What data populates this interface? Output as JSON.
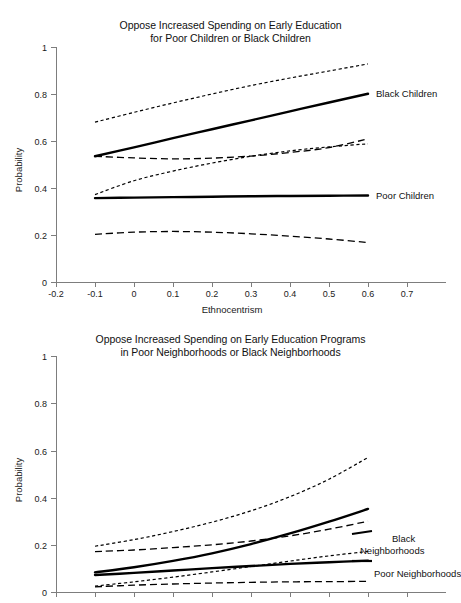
{
  "figure": {
    "background": "#ffffff",
    "ink_color": "#000000",
    "axis_color": "#7d7d7d"
  },
  "chart_data": [
    {
      "type": "line",
      "panel": "top",
      "title": "Oppose Increased Spending on Early Education for Poor Children or Black Children",
      "title_lines": [
        "Oppose Increased Spending on Early Education",
        "for Poor Children or Black Children"
      ],
      "xlabel": "Ethnocentrism",
      "ylabel": "Probability",
      "xlim": [
        -0.2,
        0.7
      ],
      "ylim": [
        0,
        1
      ],
      "xticks": [
        -0.2,
        -0.1,
        0,
        0.1,
        0.2,
        0.3,
        0.4,
        0.5,
        0.6,
        0.7
      ],
      "xticklabels": [
        "-0.2",
        "-0.1",
        "0",
        "0.1",
        "0.2",
        "0.3",
        "0.4",
        "0.5",
        "0.6",
        "0.7"
      ],
      "yticks": [
        0,
        0.2,
        0.4,
        0.6,
        0.8,
        1
      ],
      "yticklabels": [
        "0",
        "0.2",
        "0.4",
        "0.6",
        "0.8",
        "1"
      ],
      "grid": false,
      "legend_position": "inline-right-labels",
      "x": [
        -0.1,
        0.0,
        0.1,
        0.2,
        0.3,
        0.4,
        0.5,
        0.6
      ],
      "series": [
        {
          "name": "Black Children",
          "style": "solid",
          "role": "estimate",
          "label_text": "Black Children",
          "values": [
            0.535,
            0.573,
            0.612,
            0.65,
            0.688,
            0.726,
            0.764,
            0.801
          ]
        },
        {
          "name": "Black Children upper CI",
          "style": "dotted",
          "role": "confidence-upper",
          "values": [
            0.68,
            0.722,
            0.762,
            0.8,
            0.836,
            0.868,
            0.898,
            0.928
          ]
        },
        {
          "name": "Black Children lower CI",
          "style": "dotted",
          "role": "confidence-lower",
          "values": [
            0.372,
            0.431,
            0.472,
            0.506,
            0.535,
            0.558,
            0.575,
            0.588
          ]
        },
        {
          "name": "Poor Children",
          "style": "solid",
          "role": "estimate",
          "label_text": "Poor Children",
          "values": [
            0.357,
            0.359,
            0.361,
            0.363,
            0.365,
            0.366,
            0.367,
            0.368
          ]
        },
        {
          "name": "Poor Children upper CI",
          "style": "dashed",
          "role": "confidence-upper",
          "values": [
            0.535,
            0.528,
            0.524,
            0.527,
            0.536,
            0.551,
            0.572,
            0.609
          ]
        },
        {
          "name": "Poor Children lower CI",
          "style": "dashed",
          "role": "confidence-lower",
          "values": [
            0.203,
            0.212,
            0.215,
            0.212,
            0.205,
            0.195,
            0.183,
            0.168
          ]
        }
      ]
    },
    {
      "type": "line",
      "panel": "bottom",
      "title": "Oppose Increased Spending on Early Education Programs in Poor Neighborhoods or Black Neighborhoods",
      "title_lines": [
        "Oppose Increased Spending on Early Education Programs",
        "in Poor Neighborhoods or Black Neighborhoods"
      ],
      "xlabel": "",
      "ylabel": "Probability",
      "xlim": [
        -0.2,
        0.7
      ],
      "ylim": [
        0,
        1
      ],
      "xticks": [
        -0.2,
        -0.1,
        0,
        0.1,
        0.2,
        0.3,
        0.4,
        0.5,
        0.6,
        0.7
      ],
      "xticklabels": [
        "",
        "",
        "",
        "",
        "",
        "",
        "",
        "",
        "",
        ""
      ],
      "yticks": [
        0,
        0.2,
        0.4,
        0.6,
        0.8,
        1
      ],
      "yticklabels": [
        "0",
        "0.2",
        "0.4",
        "0.6",
        "0.8",
        "1"
      ],
      "grid": false,
      "legend_position": "inline-right-labels",
      "note": "x-axis tick labels are cropped off the bottom of the screenshot",
      "x": [
        -0.1,
        0.0,
        0.1,
        0.2,
        0.3,
        0.4,
        0.5,
        0.6
      ],
      "series": [
        {
          "name": "Black Neighborhoods",
          "style": "solid",
          "role": "estimate",
          "label_text": "Black Neighborhoods",
          "label_lines": [
            "Black",
            "Neighborhoods"
          ],
          "values": [
            0.083,
            0.105,
            0.132,
            0.164,
            0.203,
            0.248,
            0.298,
            0.352
          ]
        },
        {
          "name": "Black Neighborhoods upper CI",
          "style": "dotted",
          "role": "confidence-upper",
          "values": [
            0.194,
            0.222,
            0.256,
            0.296,
            0.344,
            0.404,
            0.478,
            0.57
          ]
        },
        {
          "name": "Black Neighborhoods lower CI",
          "style": "dashed",
          "role": "confidence-lower",
          "values": [
            0.171,
            0.178,
            0.188,
            0.2,
            0.216,
            0.238,
            0.266,
            0.3
          ]
        },
        {
          "name": "Poor Neighborhoods",
          "style": "solid",
          "role": "estimate",
          "label_text": "Poor Neighborhoods",
          "values": [
            0.072,
            0.081,
            0.091,
            0.101,
            0.11,
            0.119,
            0.126,
            0.133
          ]
        },
        {
          "name": "Poor Neighborhoods upper CI",
          "style": "dotted",
          "role": "confidence-upper",
          "values": [
            0.025,
            0.043,
            0.063,
            0.085,
            0.108,
            0.131,
            0.153,
            0.172
          ]
        },
        {
          "name": "Poor Neighborhoods lower CI",
          "style": "dashed",
          "role": "confidence-lower",
          "values": [
            0.022,
            0.029,
            0.034,
            0.038,
            0.041,
            0.043,
            0.044,
            0.045
          ]
        }
      ]
    }
  ]
}
